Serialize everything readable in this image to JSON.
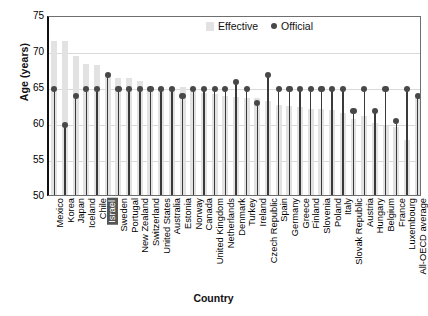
{
  "chart_data": {
    "type": "bar",
    "title": "",
    "xlabel": "Country",
    "ylabel": "Age (years)",
    "ylim": [
      50,
      75
    ],
    "yticks": [
      50,
      55,
      60,
      65,
      70,
      75
    ],
    "grid": true,
    "legend_position": "top-center",
    "highlighted_category": "Israel",
    "categories": [
      "Mexico",
      "Korea",
      "Japan",
      "Iceland",
      "Chile",
      "Israel",
      "Sweden",
      "Portugal",
      "New Zealand",
      "Switzerland",
      "United States",
      "Australia",
      "Estonia",
      "Norway",
      "Canada",
      "United Kingdom",
      "Netherlands",
      "Denmark",
      "Turkey",
      "Ireland",
      "Czech Republic",
      "Spain",
      "Germany",
      "Greece",
      "Finland",
      "Slovenia",
      "Poland",
      "Italy",
      "Slovak Republic",
      "Austria",
      "Hungary",
      "Belgium",
      "France",
      "Luxembourg",
      "All-OECD average"
    ],
    "series": [
      {
        "name": "Effective",
        "values": [
          71.4,
          71.4,
          69.3,
          68.2,
          68.0,
          67.0,
          66.2,
          66.2,
          65.8,
          65.0,
          65.0,
          65.0,
          65.0,
          64.4,
          64.2,
          64.0,
          63.7,
          63.6,
          63.5,
          63.5,
          63.0,
          62.5,
          62.3,
          62.2,
          62.0,
          62.0,
          61.8,
          61.4,
          60.5,
          61.0,
          60.0,
          59.6,
          59.4,
          57.6,
          63.5
        ]
      },
      {
        "name": "Official",
        "values": [
          65,
          60,
          64,
          65,
          65,
          67,
          65,
          65,
          65,
          65,
          65,
          65,
          64,
          65,
          65,
          65,
          65,
          66,
          65,
          63,
          67,
          65,
          65,
          65,
          65,
          65,
          65,
          65,
          62,
          65,
          62,
          65,
          60.5,
          65,
          64
        ]
      }
    ],
    "legend": [
      {
        "label": "Effective",
        "marker": "bar",
        "color": "#e2e2e2"
      },
      {
        "label": "Official",
        "marker": "dot",
        "color": "#484848"
      }
    ]
  }
}
